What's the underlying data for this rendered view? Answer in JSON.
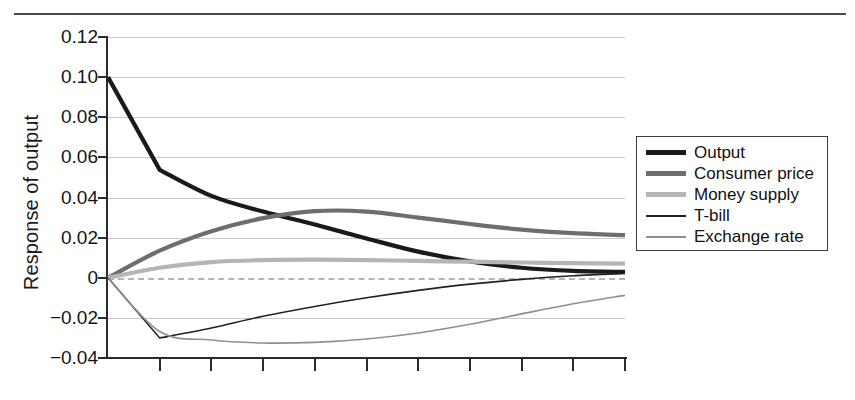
{
  "figure": {
    "top_rule": "horizontal-rule"
  },
  "chart_data": {
    "type": "line",
    "title": "",
    "xlabel": "",
    "ylabel": "Response of output",
    "ylim": [
      -0.04,
      0.12
    ],
    "xlim": [
      0,
      10
    ],
    "grid": true,
    "zero_line": true,
    "legend_position": "right",
    "ytick_labels": [
      "0.12",
      "0.10",
      "0.08",
      "0.06",
      "0.04",
      "0.02",
      "0",
      "-0.02",
      "-0.04"
    ],
    "ytick_values": [
      0.12,
      0.1,
      0.08,
      0.06,
      0.04,
      0.02,
      0,
      -0.02,
      -0.04
    ],
    "xtick_labels": [
      "",
      "",
      "",
      "",
      "",
      "",
      "",
      "",
      "",
      ""
    ],
    "x": [
      0,
      1,
      2,
      3,
      4,
      5,
      6,
      7,
      8,
      9,
      10
    ],
    "series": [
      {
        "name": "Output",
        "color": "#1a1a1a",
        "width": 4.2,
        "values": [
          0.1,
          0.0538,
          0.0408,
          0.033,
          0.0265,
          0.0196,
          0.013,
          0.0082,
          0.005,
          0.0034,
          0.0029
        ]
      },
      {
        "name": "Consumer price",
        "color": "#6e6e6e",
        "width": 4.2,
        "values": [
          0.0,
          0.0135,
          0.0232,
          0.0297,
          0.0332,
          0.033,
          0.03,
          0.0268,
          0.024,
          0.0222,
          0.0212
        ]
      },
      {
        "name": "Money supply",
        "color": "#b5b5b5",
        "width": 4.2,
        "values": [
          0.0,
          0.005,
          0.0078,
          0.0088,
          0.009,
          0.0088,
          0.0084,
          0.008,
          0.0076,
          0.0073,
          0.007
        ]
      },
      {
        "name": "T-bill",
        "color": "#222222",
        "width": 1.6,
        "values": [
          0.0,
          -0.03,
          -0.025,
          -0.0192,
          -0.0143,
          -0.01,
          -0.0063,
          -0.0032,
          -0.0008,
          0.001,
          0.0021
        ]
      },
      {
        "name": "Exchange rate",
        "color": "#8f8f8f",
        "width": 1.6,
        "values": [
          0.0,
          -0.0268,
          -0.031,
          -0.0325,
          -0.0322,
          -0.0305,
          -0.0275,
          -0.0232,
          -0.018,
          -0.013,
          -0.0088
        ]
      }
    ]
  },
  "legend": {
    "entries": [
      {
        "label": "Output"
      },
      {
        "label": "Consumer price"
      },
      {
        "label": "Money supply"
      },
      {
        "label": "T-bill"
      },
      {
        "label": "Exchange rate"
      }
    ]
  }
}
